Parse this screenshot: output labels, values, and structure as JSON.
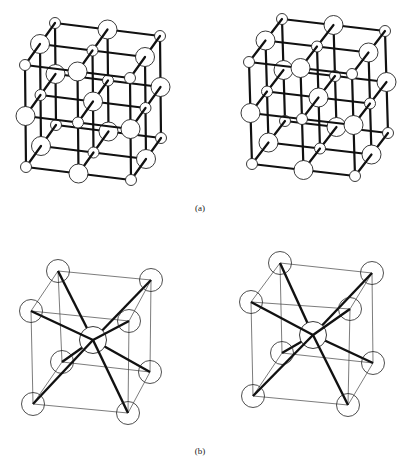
{
  "figure": {
    "captions": {
      "a": "(a)",
      "b": "(b)"
    },
    "panel_a": {
      "description": "NaCl-type rock-salt lattice, stereo pair",
      "grid": [
        3,
        3,
        3
      ],
      "atom_types": [
        "small",
        "large"
      ],
      "views": [
        "left",
        "right"
      ]
    },
    "panel_b": {
      "description": "CsCl-type body-centered cubic unit cell, stereo pair",
      "corner_atoms": 8,
      "center_atoms": 1,
      "bonds": 8,
      "views": [
        "left",
        "right"
      ]
    },
    "colors": {
      "line": "#111111",
      "atom_fill": "#ffffff",
      "atom_stroke": "#222222",
      "thin_edge": "#444444"
    }
  }
}
